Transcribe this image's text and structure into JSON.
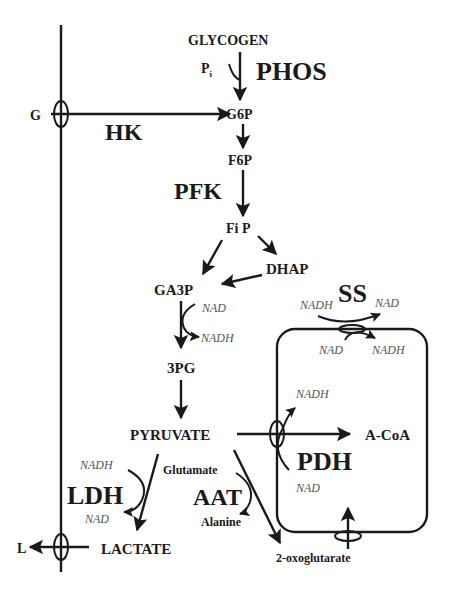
{
  "diagram": {
    "metabolites": {
      "glycogen": "GLYCOGEN",
      "pi": "P",
      "pi_sub": "i",
      "g_ext": "G",
      "g6p": "G6P",
      "f6p": "F6P",
      "fip": "Fi P",
      "dhap": "DHAP",
      "ga3p": "GA3P",
      "pg3": "3PG",
      "pyruvate": "PYRUVATE",
      "acoa": "A-CoA",
      "lactate": "LACTATE",
      "l_ext": "L",
      "glutamate": "Glutamate",
      "alanine": "Alanine",
      "oxoglutarate": "2-oxoglutarate"
    },
    "enzymes": {
      "phos": "PHOS",
      "hk": "HK",
      "pfk": "PFK",
      "ss": "SS",
      "pdh": "PDH",
      "ldh": "LDH",
      "aat": "AAT"
    },
    "cofactors": {
      "gapdh_in": "NAD",
      "gapdh_out": "NADH",
      "ss_top_in": "NADH",
      "ss_top_out": "NAD",
      "ss_bot_in": "NAD",
      "ss_bot_out": "NADH",
      "pdh_out": "NADH",
      "pdh_in": "NAD",
      "ldh_in": "NADH",
      "ldh_out": "NAD"
    },
    "colors": {
      "ink": "#1a1a1a",
      "cofactor": "#555555",
      "background": "#ffffff"
    }
  }
}
